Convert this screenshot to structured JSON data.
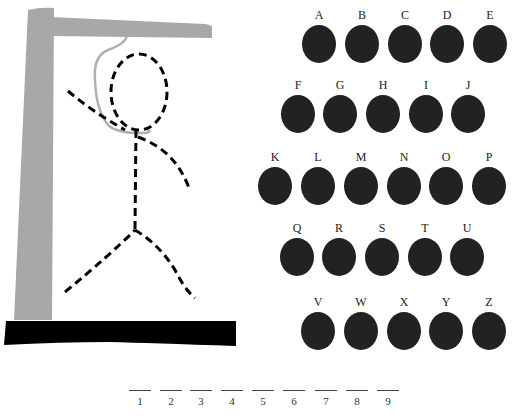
{
  "game": {
    "type": "hangman",
    "word_length": 9
  },
  "colors": {
    "gallows_post": "#a8a8a8",
    "base": "#000000",
    "rope": "#b0b0b0",
    "figure": "#000000",
    "letter_disc": "#222222",
    "text": "#222222"
  },
  "letters": {
    "row1": [
      "A",
      "B",
      "C",
      "D",
      "E"
    ],
    "row2": [
      "F",
      "G",
      "H",
      "I",
      "J"
    ],
    "row3": [
      "K",
      "L",
      "M",
      "N",
      "O",
      "P"
    ],
    "row4": [
      "Q",
      "R",
      "S",
      "T",
      "U"
    ],
    "row5": [
      "V",
      "W",
      "X",
      "Y",
      "Z"
    ]
  },
  "slots": [
    "1",
    "2",
    "3",
    "4",
    "5",
    "6",
    "7",
    "8",
    "9"
  ]
}
